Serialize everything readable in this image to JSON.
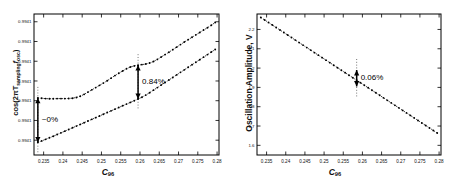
{
  "figure": {
    "background": "#ffffff",
    "ink": "#000000"
  },
  "chart_data": [
    {
      "type": "scatter",
      "panel": "left",
      "title": "",
      "xlabel": "C96",
      "ylabel": "cos(2πT_sampling f_osc)",
      "xlim": [
        0.2325,
        0.2805
      ],
      "ylim": [
        0.0,
        1.0
      ],
      "grid": false,
      "legend": "none",
      "xticks": [
        0.235,
        0.24,
        0.245,
        0.25,
        0.255,
        0.26,
        0.265,
        0.27,
        0.275,
        0.28
      ],
      "xticklabels": [
        "0.235",
        "0.24",
        "0.245",
        "0.25",
        "0.255",
        "0.26",
        "0.265",
        "0.27",
        "0.275",
        "0.28"
      ],
      "yticks": [
        0.105,
        0.245,
        0.385,
        0.525,
        0.665,
        0.805,
        0.945
      ],
      "yticklabels": [
        "0.9941",
        "0.9941",
        "0.9941",
        "0.9941",
        "0.9941",
        "0.9941",
        "0.9941"
      ],
      "series": [
        {
          "name": "upper-branch",
          "marker": "dot",
          "linestyle": "dotted",
          "x": [
            0.2335,
            0.2345,
            0.2355,
            0.2365,
            0.2375,
            0.2385,
            0.2395,
            0.2405,
            0.2415,
            0.2425,
            0.2435,
            0.2445,
            0.2455,
            0.2465,
            0.2475,
            0.2485,
            0.2495,
            0.2505,
            0.2515,
            0.2525,
            0.2535,
            0.2545,
            0.2555,
            0.2565,
            0.2575,
            0.2585,
            0.2595,
            0.2605,
            0.2615,
            0.2625,
            0.2635,
            0.2645,
            0.2655,
            0.2665,
            0.2675,
            0.2685,
            0.2695,
            0.2705,
            0.2715,
            0.2725,
            0.2735,
            0.2745,
            0.2755,
            0.2765,
            0.2775,
            0.2785,
            0.2795
          ],
          "y": [
            0.405,
            0.402,
            0.4,
            0.399,
            0.399,
            0.4,
            0.4,
            0.4,
            0.401,
            0.403,
            0.408,
            0.417,
            0.43,
            0.446,
            0.462,
            0.478,
            0.494,
            0.51,
            0.527,
            0.545,
            0.563,
            0.58,
            0.596,
            0.612,
            0.624,
            0.632,
            0.637,
            0.641,
            0.645,
            0.652,
            0.663,
            0.678,
            0.695,
            0.712,
            0.729,
            0.747,
            0.765,
            0.783,
            0.801,
            0.818,
            0.835,
            0.852,
            0.869,
            0.886,
            0.903,
            0.92,
            0.94
          ]
        },
        {
          "name": "lower-branch",
          "marker": "dot",
          "linestyle": "dotted",
          "x": [
            0.2335,
            0.2345,
            0.2355,
            0.2365,
            0.2375,
            0.2385,
            0.2395,
            0.2405,
            0.2415,
            0.2425,
            0.2435,
            0.2445,
            0.2455,
            0.2465,
            0.2475,
            0.2485,
            0.2495,
            0.2505,
            0.2515,
            0.2525,
            0.2535,
            0.2545,
            0.2555,
            0.2565,
            0.2575,
            0.2585,
            0.2595,
            0.2605,
            0.2615,
            0.2625,
            0.2635,
            0.2645,
            0.2655,
            0.2665,
            0.2675,
            0.2685,
            0.2695,
            0.2705,
            0.2715,
            0.2725,
            0.2735,
            0.2745,
            0.2755,
            0.2765,
            0.2775,
            0.2785,
            0.2795
          ],
          "y": [
            0.09,
            0.1,
            0.111,
            0.122,
            0.133,
            0.145,
            0.157,
            0.169,
            0.181,
            0.193,
            0.205,
            0.217,
            0.229,
            0.241,
            0.253,
            0.265,
            0.277,
            0.289,
            0.301,
            0.313,
            0.325,
            0.337,
            0.349,
            0.361,
            0.373,
            0.385,
            0.397,
            0.41,
            0.425,
            0.442,
            0.46,
            0.478,
            0.496,
            0.514,
            0.532,
            0.55,
            0.568,
            0.586,
            0.604,
            0.622,
            0.64,
            0.658,
            0.676,
            0.694,
            0.712,
            0.73,
            0.748
          ]
        }
      ],
      "annotations": [
        {
          "label": "~0%",
          "x": 0.2335,
          "y_top": 0.405,
          "y_bottom": 0.09,
          "style": "double-arrow"
        },
        {
          "label": "0.84%",
          "x": 0.2595,
          "y_top": 0.637,
          "y_bottom": 0.397,
          "style": "double-arrow"
        }
      ]
    },
    {
      "type": "scatter",
      "panel": "right",
      "title": "",
      "xlabel": "C96",
      "ylabel": "Oscillation Amplitude, V",
      "xlim": [
        0.2325,
        0.2805
      ],
      "ylim": [
        1.55,
        2.28
      ],
      "grid": false,
      "legend": "none",
      "xticks": [
        0.235,
        0.24,
        0.245,
        0.25,
        0.255,
        0.26,
        0.265,
        0.27,
        0.275,
        0.28
      ],
      "xticklabels": [
        "0.235",
        "0.24",
        "0.245",
        "0.25",
        "0.255",
        "0.26",
        "0.265",
        "0.27",
        "0.275",
        "0.28"
      ],
      "yticks": [
        2.2,
        2.1,
        2.0,
        1.9,
        1.8,
        1.7,
        1.6
      ],
      "yticklabels": [
        "2.2",
        "2.1",
        "2",
        "1.9",
        "1.8",
        "1.7",
        "1.6"
      ],
      "series": [
        {
          "name": "amplitude",
          "marker": "dot",
          "linestyle": "dotted",
          "x": [
            0.2335,
            0.2345,
            0.2355,
            0.2365,
            0.2375,
            0.2385,
            0.2395,
            0.2405,
            0.2415,
            0.2425,
            0.2435,
            0.2445,
            0.2455,
            0.2465,
            0.2475,
            0.2485,
            0.2495,
            0.2505,
            0.2515,
            0.2525,
            0.2535,
            0.2545,
            0.2555,
            0.2565,
            0.2575,
            0.2585,
            0.2595,
            0.2605,
            0.2615,
            0.2625,
            0.2635,
            0.2645,
            0.2655,
            0.2665,
            0.2675,
            0.2685,
            0.2695,
            0.2705,
            0.2715,
            0.2725,
            0.2735,
            0.2745,
            0.2755,
            0.2765,
            0.2775,
            0.2785,
            0.2795
          ],
          "y": [
            2.262,
            2.249,
            2.236,
            2.223,
            2.21,
            2.197,
            2.184,
            2.171,
            2.158,
            2.145,
            2.132,
            2.119,
            2.106,
            2.093,
            2.08,
            2.067,
            2.054,
            2.041,
            2.028,
            2.015,
            2.002,
            1.989,
            1.976,
            1.963,
            1.95,
            1.937,
            1.924,
            1.911,
            1.898,
            1.885,
            1.872,
            1.859,
            1.846,
            1.833,
            1.82,
            1.807,
            1.794,
            1.781,
            1.768,
            1.755,
            1.742,
            1.729,
            1.716,
            1.703,
            1.69,
            1.677,
            1.664
          ]
        }
      ],
      "annotations": [
        {
          "label": "0.06%",
          "x": 0.2585,
          "y_top": 1.99,
          "y_bottom": 1.905,
          "style": "double-arrow"
        }
      ]
    }
  ]
}
